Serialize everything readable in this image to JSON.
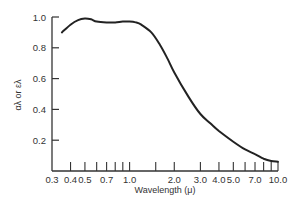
{
  "chart_data": {
    "type": "line",
    "title": "",
    "xlabel": "Wavelength (μ)",
    "ylabel": "αλ or ελ",
    "x_scale": "log",
    "xlim": [
      0.3,
      10.0
    ],
    "ylim": [
      0.0,
      1.0
    ],
    "grid": false,
    "legend": null,
    "x_tick_labels": [
      "0.3",
      "0.4",
      "0.5",
      "0.7",
      "1.0",
      "2.0",
      "3.0",
      "4.0",
      "5.0",
      "7.0",
      "10.0"
    ],
    "x_tick_values": [
      0.3,
      0.4,
      0.5,
      0.7,
      1.0,
      2.0,
      3.0,
      4.0,
      5.0,
      7.0,
      10.0
    ],
    "x_minor_ticks": [
      0.6,
      0.8,
      0.9,
      1.5,
      6.0,
      8.0,
      9.0
    ],
    "y_tick_labels": [
      "0.2",
      "0.4",
      "0.6",
      "0.8",
      "1.0"
    ],
    "y_tick_values": [
      0.2,
      0.4,
      0.6,
      0.8,
      1.0
    ],
    "series": [
      {
        "name": "absorptivity / emissivity",
        "color": "#222222",
        "x": [
          0.35,
          0.4,
          0.45,
          0.5,
          0.55,
          0.6,
          0.7,
          0.8,
          0.9,
          1.0,
          1.1,
          1.2,
          1.4,
          1.6,
          1.8,
          2.0,
          2.5,
          3.0,
          3.5,
          4.0,
          5.0,
          6.0,
          7.0,
          8.0,
          9.0,
          10.0
        ],
        "y": [
          0.9,
          0.95,
          0.98,
          0.99,
          0.985,
          0.97,
          0.965,
          0.965,
          0.97,
          0.97,
          0.965,
          0.95,
          0.9,
          0.82,
          0.73,
          0.64,
          0.48,
          0.37,
          0.31,
          0.26,
          0.19,
          0.14,
          0.11,
          0.08,
          0.065,
          0.06
        ]
      }
    ]
  }
}
